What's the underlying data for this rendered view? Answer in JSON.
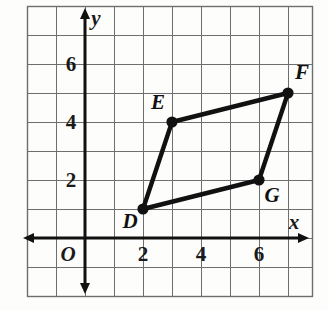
{
  "figure": {
    "background_color": "#fdfdfc",
    "ink_color": "#111111",
    "grid_color": "#6e6e6e",
    "axis_color": "#111111"
  },
  "axes": {
    "x_label": "x",
    "y_label": "y",
    "origin_label": "O",
    "x_ticks": [
      {
        "label": "2",
        "value": 2
      },
      {
        "label": "4",
        "value": 4
      },
      {
        "label": "6",
        "value": 6
      }
    ],
    "y_ticks": [
      {
        "label": "2",
        "value": 2
      },
      {
        "label": "4",
        "value": 4
      },
      {
        "label": "6",
        "value": 6
      }
    ],
    "x_range": [
      -2,
      8.5
    ],
    "y_range": [
      -2,
      7.5
    ],
    "grid": true,
    "grid_step": 1
  },
  "chart_data": {
    "type": "scatter",
    "title": "",
    "xlabel": "x",
    "ylabel": "y",
    "xlim": [
      -2,
      8.5
    ],
    "ylim": [
      -2,
      7.5
    ],
    "grid": true,
    "legend": "none",
    "shape": "quadrilateral",
    "closed": true,
    "points": [
      {
        "name": "D",
        "x": 2,
        "y": 1,
        "label": "D",
        "label_position": "below-left"
      },
      {
        "name": "E",
        "x": 3,
        "y": 4,
        "label": "E",
        "label_position": "above-left"
      },
      {
        "name": "F",
        "x": 7,
        "y": 5,
        "label": "F",
        "label_position": "above-right"
      },
      {
        "name": "G",
        "x": 6,
        "y": 2,
        "label": "G",
        "label_position": "below-right"
      }
    ],
    "edges": [
      {
        "from": "D",
        "to": "E"
      },
      {
        "from": "E",
        "to": "F"
      },
      {
        "from": "F",
        "to": "G"
      },
      {
        "from": "G",
        "to": "D"
      }
    ]
  }
}
